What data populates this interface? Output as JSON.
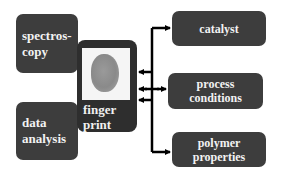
{
  "diagram": {
    "inputs": [
      {
        "id": "spectroscopy",
        "label_lines": [
          "spectros-",
          "copy"
        ]
      },
      {
        "id": "data-analysis",
        "label_lines": [
          "data",
          "analysis"
        ]
      }
    ],
    "center": {
      "id": "fingerprint",
      "label_lines": [
        "finger",
        "print"
      ],
      "image": "fingerprint-image"
    },
    "outputs": [
      {
        "id": "catalyst",
        "label_lines": [
          "catalyst"
        ]
      },
      {
        "id": "process-conditions",
        "label_lines": [
          "process",
          "conditions"
        ]
      },
      {
        "id": "polymer-properties",
        "label_lines": [
          "polymer",
          "properties"
        ]
      }
    ],
    "connections": [
      {
        "from": "catalyst",
        "to": "fingerprint",
        "arrow": "into-fingerprint"
      },
      {
        "from": "process-conditions",
        "to": "fingerprint",
        "arrow": "bidirectional"
      },
      {
        "from": "polymer-properties",
        "to": "fingerprint",
        "arrow": "into-fingerprint"
      },
      {
        "from": "fingerprint",
        "to": "catalyst",
        "arrow": "into-catalyst"
      },
      {
        "from": "fingerprint",
        "to": "polymer-properties",
        "arrow": "into-polymer-properties"
      }
    ],
    "colors": {
      "box": "#3d3d3d",
      "text": "#f2f2f2",
      "arrow": "#000000",
      "background": "#ffffff"
    }
  }
}
